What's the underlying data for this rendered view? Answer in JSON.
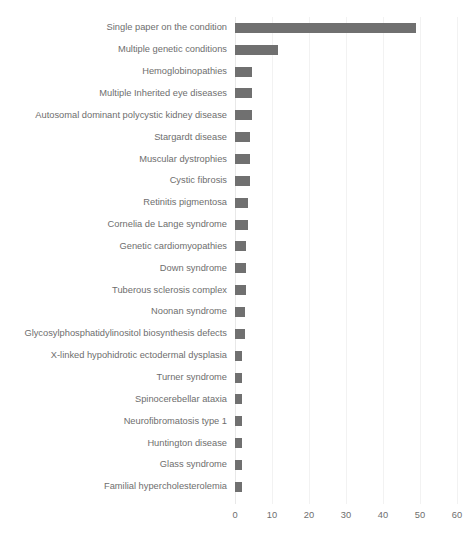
{
  "chart_data": {
    "type": "bar",
    "orientation": "horizontal",
    "title": "",
    "xlabel": "",
    "ylabel": "",
    "xlim": [
      0,
      60
    ],
    "xticks": [
      0,
      10,
      20,
      30,
      40,
      50,
      60
    ],
    "grid": true,
    "legend": false,
    "bar_color": "#707070",
    "gridline_color": "#f2f2f2",
    "text_color": "#6e6e6e",
    "categories": [
      "Single paper on the condition",
      "Multiple genetic conditions",
      "Hemoglobinopathies",
      "Multiple Inherited eye diseases",
      "Autosomal dominant polycystic kidney disease",
      "Stargardt disease",
      "Muscular dystrophies",
      "Cystic fibrosis",
      "Retinitis pigmentosa",
      "Cornelia de Lange syndrome",
      "Genetic cardiomyopathies",
      "Down syndrome",
      "Tuberous sclerosis complex",
      "Noonan syndrome",
      "Glycosylphosphatidylinositol biosynthesis defects",
      "X-linked hypohidrotic ectodermal dysplasia",
      "Turner  syndrome",
      "Spinocerebellar ataxia",
      "Neurofibromatosis type 1",
      "Huntington  disease",
      "Glass syndrome",
      "Familial hypercholesterolemia"
    ],
    "values": [
      49,
      11.5,
      4.6,
      4.6,
      4.6,
      4,
      4,
      4,
      3.6,
      3.6,
      3,
      3,
      3,
      2.6,
      2.6,
      2,
      2,
      2,
      2,
      2,
      2,
      2
    ]
  }
}
